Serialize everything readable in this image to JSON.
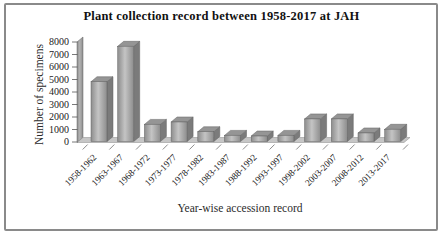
{
  "chart_data": {
    "type": "bar",
    "style": "3d-column-grayscale",
    "title": "Plant collection record between 1958-2017 at JAH",
    "xlabel": "Year-wise accession record",
    "ylabel": "Number of specimens",
    "categories": [
      "1958-1962",
      "1963-1967",
      "1968-1972",
      "1973-1977",
      "1978-1982",
      "1983-1987",
      "1988-1992",
      "1993-1997",
      "1998-2002",
      "2003-2007",
      "2008-2012",
      "2013-2017"
    ],
    "values": [
      4900,
      7800,
      1400,
      1600,
      800,
      500,
      450,
      500,
      1850,
      1850,
      700,
      1000
    ],
    "ylim": [
      0,
      8000
    ],
    "yticks": [
      0,
      1000,
      2000,
      3000,
      4000,
      5000,
      6000,
      7000,
      8000
    ],
    "grid": false,
    "legend": false
  },
  "colors": {
    "bar_front_light": "#c4c4c4",
    "bar_front_dark": "#8d8d8d",
    "bar_top": "#959595",
    "bar_side": "#7b7b7b",
    "wall_light": "#b2b2b2",
    "wall_dark": "#8d8d8d",
    "floor": "#c6c6c6",
    "outline": "#636363",
    "frame_border": "#8a8a8a",
    "text": "#1a1a1a"
  }
}
